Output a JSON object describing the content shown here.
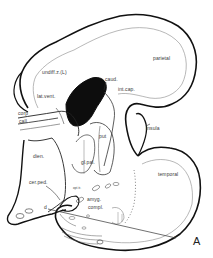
{
  "figure": {
    "panel_letter": "A",
    "colors": {
      "outline": "#111111",
      "inner_line": "#9a9a9a",
      "fill_dark": "#0d0d0d",
      "background": "#ffffff",
      "text": "#3a3a3a"
    },
    "labels": {
      "parietal": "parietal",
      "undiff": "undiff.z.(L)",
      "caud": "caud.",
      "int_cap": "int.cap.",
      "lat_vent": "lat.vent.",
      "corp": "corp",
      "call": "call",
      "put": "put",
      "insula": "insula",
      "dien": "dien.",
      "gl_pal": "gl.pal.",
      "temporal": "temporal",
      "cer_ped": "cer.ped.",
      "opt_tr": "opt.tr.",
      "amyg": "amyg.",
      "compl": "compl.",
      "d": "d",
      "x": "x"
    }
  }
}
